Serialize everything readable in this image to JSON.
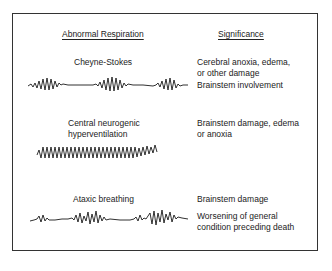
{
  "headers": {
    "left": "Abnormal Respiration",
    "right": "Significance"
  },
  "patterns": [
    {
      "name": "Cheyne-Stokes",
      "significance": [
        "Cerebral anoxia, edema, or other damage",
        "Brainstem involvement"
      ],
      "significance_lines": [
        "Cerebral anoxia, edema,",
        "or other damage"
      ],
      "significance_extra": "Brainstem involvement",
      "waveform": "crescendo-decrescendo bursts separated by apnea (3 bursts)"
    },
    {
      "name": "Central neurogenic hyperventilation",
      "name_lines": [
        "Central neurogenic",
        "hyperventilation"
      ],
      "significance_lines": [
        "Brainstem damage, edema",
        "or anoxia"
      ],
      "waveform": "continuous rapid regular deep oscillation"
    },
    {
      "name": "Ataxic breathing",
      "significance_line1": "Brainstem damage",
      "significance_lines": [
        "Worsening of general",
        "condition preceding death"
      ],
      "waveform": "irregular, chaotic amplitude and timing"
    }
  ],
  "colors": {
    "ink": "#1a1a1a",
    "border": "#333333",
    "background": "#ffffff"
  }
}
